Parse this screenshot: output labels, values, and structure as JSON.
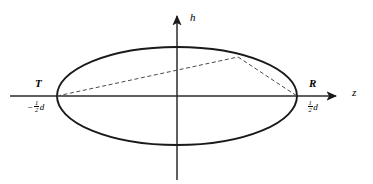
{
  "figure": {
    "type": "geometry-diagram",
    "background_color": "#ffffff",
    "stroke_color": "#1a1a1a",
    "axis_color": "#2b2b2b",
    "dash_color": "#4a4a4a"
  },
  "axes": {
    "vertical": {
      "label": "h",
      "label_x": 190,
      "label_y": 12,
      "x": 177,
      "y_top": 11,
      "y_bottom": 180,
      "arrow": "up"
    },
    "horizontal": {
      "label": "z",
      "label_x": 352,
      "label_y": 87,
      "y": 96,
      "x_left": 10,
      "x_right": 341,
      "arrow": "right"
    }
  },
  "ellipse": {
    "center_x": 177,
    "center_y": 96,
    "radius_x": 120,
    "radius_y": 49
  },
  "points": {
    "transmitter": {
      "name": "T",
      "label": "T",
      "coord_minus": "−",
      "coord_num": "1",
      "coord_den": "2",
      "coord_var": "d",
      "x": 57,
      "y": 96,
      "label_x": 35,
      "label_y": 78,
      "coord_x": 27,
      "coord_y": 100
    },
    "receiver": {
      "name": "R",
      "label": "R",
      "coord_num": "1",
      "coord_den": "2",
      "coord_var": "d",
      "x": 297,
      "y": 96,
      "label_x": 309,
      "label_y": 78,
      "coord_x": 307,
      "coord_y": 100
    },
    "reflection": {
      "name": "reflection-point",
      "x": 238,
      "y": 57
    }
  },
  "rays": [
    {
      "name": "ray-transmitter-to-reflection",
      "x1": 57,
      "y1": 96,
      "x2": 238,
      "y2": 57
    },
    {
      "name": "ray-reflection-to-receiver",
      "x1": 238,
      "y1": 57,
      "x2": 297,
      "y2": 96
    }
  ]
}
